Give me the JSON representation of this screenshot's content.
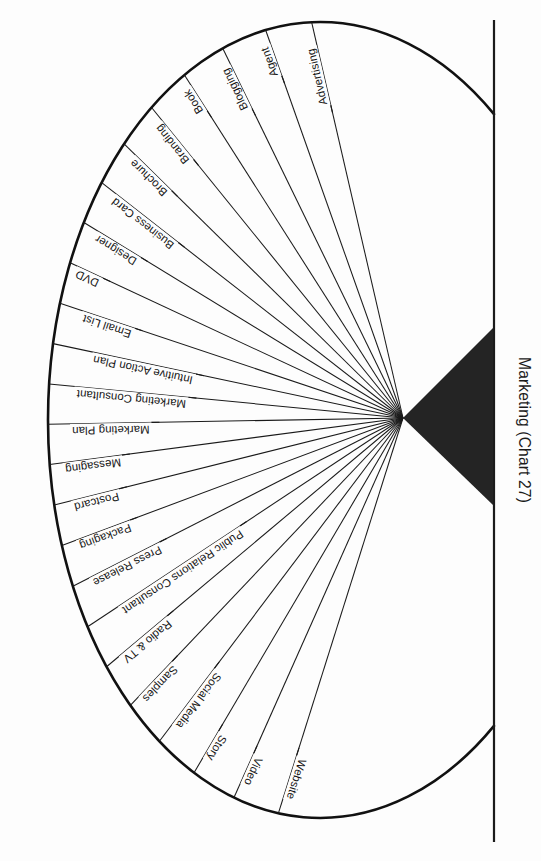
{
  "chart_data": {
    "type": "pie",
    "title": "Marketing (Chart 27)",
    "subtitle": "",
    "xlabel": "",
    "ylabel": "",
    "legend_position": "none",
    "grid": false,
    "layout": "radial fan / half-wheel diagram, hub at right, spokes radiating left",
    "note": "Equal-weight radial spoke diagram; all 24 segments are drawn at equal angular spacing across the left half-disc.",
    "categories": [
      "Website",
      "Video",
      "Story",
      "Social Media",
      "Samples",
      "Radio & TV",
      "Public Relations Consultant",
      "Press Release",
      "Packaging",
      "Postcard",
      "Messaging",
      "Marketing Plan",
      "Marketing Consultant",
      "Intuitive Action Plan",
      "Email List",
      "DVD",
      "Designer",
      "Business Card",
      "Brochure",
      "Branding",
      "Book",
      "Blogging",
      "Agent",
      "Advertising"
    ],
    "values": [
      1,
      1,
      1,
      1,
      1,
      1,
      1,
      1,
      1,
      1,
      1,
      1,
      1,
      1,
      1,
      1,
      1,
      1,
      1,
      1,
      1,
      1,
      1,
      1
    ],
    "series": [
      {
        "name": "Marketing elements",
        "values": [
          1,
          1,
          1,
          1,
          1,
          1,
          1,
          1,
          1,
          1,
          1,
          1,
          1,
          1,
          1,
          1,
          1,
          1,
          1,
          1,
          1,
          1,
          1,
          1
        ]
      }
    ],
    "count": 24
  },
  "figure": {
    "title": "Marketing (Chart 27)",
    "hub_label": "",
    "colors": {
      "ink": "#1a1a1a",
      "hub_fill": "#242424",
      "background": "#fdfdfd",
      "outline": "#111111"
    }
  },
  "spokes": [
    {
      "label": "Website",
      "angle_deg": -72.5
    },
    {
      "label": "Video",
      "angle_deg": -66.0
    },
    {
      "label": "Story",
      "angle_deg": -59.5
    },
    {
      "label": "Social Media",
      "angle_deg": -53.0
    },
    {
      "label": "Samples",
      "angle_deg": -46.5
    },
    {
      "label": "Radio & TV",
      "angle_deg": -40.0
    },
    {
      "label": "Public Relations Consultant",
      "angle_deg": -33.5
    },
    {
      "label": "Press Release",
      "angle_deg": -27.0
    },
    {
      "label": "Packaging",
      "angle_deg": -20.5
    },
    {
      "label": "Postcard",
      "angle_deg": -14.0
    },
    {
      "label": "Messaging",
      "angle_deg": -7.5
    },
    {
      "label": "Marketing Plan",
      "angle_deg": -1.0
    },
    {
      "label": "Marketing Consultant",
      "angle_deg": 5.5
    },
    {
      "label": "Intuitive Action Plan",
      "angle_deg": 12.0
    },
    {
      "label": "Email List",
      "angle_deg": 18.5
    },
    {
      "label": "DVD",
      "angle_deg": 25.0
    },
    {
      "label": "Designer",
      "angle_deg": 31.5
    },
    {
      "label": "Business Card",
      "angle_deg": 38.0
    },
    {
      "label": "Brochure",
      "angle_deg": 44.5
    },
    {
      "label": "Branding",
      "angle_deg": 51.0
    },
    {
      "label": "Book",
      "angle_deg": 57.5
    },
    {
      "label": "Blogging",
      "angle_deg": 64.0
    },
    {
      "label": "Agent",
      "angle_deg": 70.5
    },
    {
      "label": "Advertising",
      "angle_deg": 77.0
    }
  ],
  "geometry": {
    "hub_x": 403,
    "hub_y": 418,
    "center_x": 320,
    "center_y": 420,
    "radius_x": 272,
    "radius_y": 398,
    "axis_x": 494,
    "axis_top_y": 20,
    "axis_bottom_y": 842,
    "hub_right_x": 493,
    "hub_top_y": 328,
    "hub_bottom_y": 505
  }
}
